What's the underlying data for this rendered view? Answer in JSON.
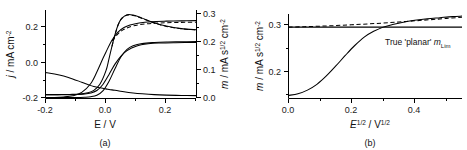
{
  "figure": {
    "caption_a": "(a)",
    "caption_b": "(b)"
  },
  "panel_a": {
    "xlabel_main": "E / V",
    "ylabel_left_parts": {
      "symbol": "j",
      "unit": " / mA cm",
      "exp": "-2"
    },
    "ylabel_right_parts": {
      "symbol": "m",
      "unit_a": " / mA s",
      "exp_a": "1/2",
      "unit_b": " cm",
      "exp_b": "-2"
    },
    "xticks": [
      "-0.2",
      "0.0",
      "0.2"
    ],
    "yticks_left": [
      "0.2",
      "0.0",
      "-0.2"
    ],
    "yticks_right": [
      "0.3",
      "0.2",
      "0.1",
      "0.0"
    ]
  },
  "panel_b": {
    "xlabel_parts": {
      "sym1": "E",
      "exp1": "1/2",
      "mid": " / V",
      "exp2": "1/2"
    },
    "ylabel_parts": {
      "symbol": "m",
      "unit_a": " / mA s",
      "exp_a": "1/2",
      "unit_b": " cm",
      "exp_b": "-2"
    },
    "xticks": [
      "0.0",
      "0.2",
      "0.4"
    ],
    "yticks": [
      "0.3",
      "0.2"
    ],
    "annotation": {
      "text": "True 'planar' ",
      "symbol": "m",
      "subscript": "Lim"
    }
  },
  "chart_data": [
    {
      "type": "line",
      "panel": "a",
      "title": "",
      "xlabel": "E / V",
      "ylabel": "j / mA cm-2",
      "ylabel_secondary": "m / mA s1/2 cm-2",
      "xlim": [
        -0.2,
        0.3
      ],
      "ylim": [
        -0.22,
        0.3
      ],
      "ylim_secondary": [
        0.0,
        0.33
      ],
      "grid": false,
      "legend": "none",
      "series": [
        {
          "name": "cv-forward-peak",
          "axis": "left",
          "style": "solid",
          "x": [
            -0.2,
            -0.16,
            -0.12,
            -0.09,
            -0.06,
            -0.04,
            -0.02,
            0.0,
            0.01,
            0.02,
            0.03,
            0.04,
            0.05,
            0.07,
            0.09,
            0.12,
            0.16,
            0.2,
            0.25,
            0.3
          ],
          "y": [
            -0.2,
            -0.2,
            -0.199,
            -0.197,
            -0.189,
            -0.175,
            -0.139,
            -0.06,
            0.01,
            0.085,
            0.155,
            0.21,
            0.245,
            0.272,
            0.27,
            0.252,
            0.225,
            0.205,
            0.19,
            0.183
          ]
        },
        {
          "name": "cv-forward-peak-dashed-overlay",
          "axis": "left",
          "style": "dashed",
          "x": [
            0.02,
            0.04,
            0.06,
            0.09,
            0.12,
            0.16,
            0.2,
            0.25,
            0.3
          ],
          "y": [
            0.085,
            0.21,
            0.263,
            0.268,
            0.25,
            0.223,
            0.203,
            0.189,
            0.182
          ]
        },
        {
          "name": "cv-reverse-branch",
          "axis": "left",
          "style": "solid",
          "x": [
            -0.2,
            -0.16,
            -0.13,
            -0.1,
            -0.07,
            -0.05,
            -0.03,
            -0.01,
            0.01,
            0.03,
            0.05,
            0.07,
            0.1,
            0.14,
            0.18,
            0.23,
            0.3
          ],
          "y": [
            -0.2,
            -0.2,
            -0.2,
            -0.199,
            -0.196,
            -0.19,
            -0.176,
            -0.14,
            -0.082,
            -0.02,
            0.028,
            0.06,
            0.086,
            0.1,
            0.105,
            0.107,
            0.108
          ]
        },
        {
          "name": "steady-state-sigmoid",
          "axis": "left",
          "style": "solid",
          "x": [
            -0.2,
            -0.17,
            -0.14,
            -0.11,
            -0.08,
            -0.06,
            -0.04,
            -0.02,
            0.0,
            0.02,
            0.04,
            0.06,
            0.09,
            0.12,
            0.16,
            0.2,
            0.25,
            0.3
          ],
          "y": [
            -0.07,
            -0.078,
            -0.09,
            -0.107,
            -0.127,
            -0.14,
            -0.152,
            -0.16,
            -0.166,
            -0.172,
            -0.177,
            -0.183,
            -0.19,
            -0.195,
            -0.2,
            -0.203,
            -0.205,
            -0.206
          ]
        },
        {
          "name": "mass-response-rising",
          "axis": "right",
          "style": "solid",
          "x": [
            -0.2,
            -0.17,
            -0.14,
            -0.11,
            -0.08,
            -0.05,
            -0.03,
            -0.01,
            0.0,
            0.02,
            0.04,
            0.06,
            0.08,
            0.11,
            0.15,
            0.2,
            0.25,
            0.3
          ],
          "y": [
            0.0,
            0.0,
            0.002,
            0.007,
            0.02,
            0.055,
            0.1,
            0.153,
            0.178,
            0.225,
            0.257,
            0.275,
            0.285,
            0.293,
            0.298,
            0.3,
            0.301,
            0.302
          ]
        },
        {
          "name": "mass-response-rising-dashed",
          "axis": "right",
          "style": "dashed",
          "x": [
            0.02,
            0.04,
            0.06,
            0.09,
            0.13,
            0.18,
            0.24,
            0.3
          ],
          "y": [
            0.222,
            0.25,
            0.268,
            0.281,
            0.289,
            0.293,
            0.295,
            0.296
          ]
        },
        {
          "name": "mass-response-delayed",
          "axis": "right",
          "style": "solid",
          "x": [
            -0.2,
            -0.15,
            -0.1,
            -0.07,
            -0.05,
            -0.03,
            -0.01,
            0.01,
            0.03,
            0.05,
            0.07,
            0.09,
            0.12,
            0.16,
            0.2,
            0.25,
            0.3
          ],
          "y": [
            0.0,
            0.0,
            0.0,
            0.001,
            0.003,
            0.009,
            0.026,
            0.063,
            0.113,
            0.16,
            0.189,
            0.203,
            0.212,
            0.216,
            0.218,
            0.219,
            0.22
          ]
        }
      ]
    },
    {
      "type": "line",
      "panel": "b",
      "title": "",
      "xlabel": "E1/2 / V1/2",
      "ylabel": "m / mA s1/2 cm-2",
      "xlim": [
        0.0,
        0.55
      ],
      "ylim": [
        0.165,
        0.325
      ],
      "grid": false,
      "legend": "none",
      "annotations": [
        {
          "text": "True 'planar' mLim",
          "x": 0.33,
          "y": 0.293
        }
      ],
      "series": [
        {
          "name": "true-planar-limit-line",
          "style": "solid-horizontal",
          "x": [
            0.0,
            0.55
          ],
          "y": [
            0.3,
            0.3
          ]
        },
        {
          "name": "apparent-limit-dashed",
          "style": "dashed",
          "x": [
            0.0,
            0.05,
            0.1,
            0.15,
            0.2,
            0.25,
            0.3,
            0.35,
            0.4,
            0.45,
            0.5,
            0.55
          ],
          "y": [
            0.3,
            0.3008,
            0.3018,
            0.303,
            0.3045,
            0.306,
            0.3078,
            0.3098,
            0.312,
            0.3142,
            0.3165,
            0.319
          ]
        },
        {
          "name": "measured-mass-sigmoid",
          "style": "solid",
          "x": [
            0.0,
            0.03,
            0.06,
            0.09,
            0.12,
            0.15,
            0.18,
            0.21,
            0.24,
            0.27,
            0.3,
            0.33,
            0.36,
            0.4,
            0.44,
            0.48,
            0.52,
            0.55
          ],
          "y": [
            0.17,
            0.173,
            0.18,
            0.191,
            0.207,
            0.226,
            0.246,
            0.265,
            0.281,
            0.292,
            0.3,
            0.305,
            0.309,
            0.313,
            0.316,
            0.318,
            0.32,
            0.321
          ]
        }
      ]
    }
  ]
}
